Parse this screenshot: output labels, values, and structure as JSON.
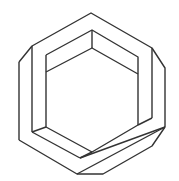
{
  "figure": {
    "stroke_color": "#333333",
    "background": "#ffffff"
  }
}
